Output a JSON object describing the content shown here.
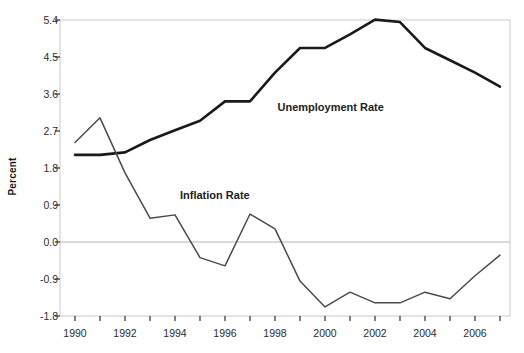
{
  "chart_data": {
    "type": "line",
    "title": "",
    "xlabel": "",
    "ylabel": "Percent",
    "xlim": [
      1989.4,
      2007.4
    ],
    "ylim": [
      -1.8,
      5.4
    ],
    "yticks": [
      -1.8,
      -0.9,
      0.0,
      0.9,
      1.8,
      2.7,
      3.6,
      4.5,
      5.4
    ],
    "ytick_labels": [
      "-1.8",
      "-0.9",
      "0.0",
      "0.9",
      "1.8",
      "2.7",
      "3.6",
      "4.5",
      "5.4"
    ],
    "xticks": [
      1990,
      1991,
      1992,
      1993,
      1994,
      1995,
      1996,
      1997,
      1998,
      1999,
      2000,
      2001,
      2002,
      2003,
      2004,
      2005,
      2006,
      2007
    ],
    "xtick_labels": [
      "1990",
      "",
      "1992",
      "",
      "1994",
      "",
      "1996",
      "",
      "1998",
      "",
      "2000",
      "",
      "2002",
      "",
      "2004",
      "",
      "2006",
      ""
    ],
    "xtick_labels_shown": [
      "1990",
      "1992",
      "1994",
      "1996",
      "1998",
      "2000",
      "2002",
      "2004",
      "2006"
    ],
    "grid": false,
    "zero_reference_line": 0.0,
    "legend_position": "inline-annotation",
    "x": [
      1990,
      1991,
      1992,
      1993,
      1994,
      1995,
      1996,
      1997,
      1998,
      1999,
      2000,
      2001,
      2002,
      2003,
      2004,
      2005,
      2006,
      2007
    ],
    "series": [
      {
        "name": "Unemployment Rate",
        "color": "#1a1a1a",
        "line_width": 2.6,
        "label_x": 1998.1,
        "label_y": 3.25,
        "values": [
          2.12,
          2.12,
          2.18,
          2.48,
          2.72,
          2.95,
          3.42,
          3.42,
          4.12,
          4.72,
          4.72,
          5.05,
          5.41,
          5.35,
          4.72,
          4.42,
          4.12,
          3.78
        ]
      },
      {
        "name": "Inflation Rate",
        "color": "#4a4a4a",
        "line_width": 1.5,
        "label_x": 1994.2,
        "label_y": 1.12,
        "values": [
          2.42,
          3.02,
          1.68,
          0.58,
          0.66,
          -0.38,
          -0.58,
          0.68,
          0.32,
          -0.95,
          -1.58,
          -1.22,
          -1.48,
          -1.48,
          -1.22,
          -1.38,
          -0.82,
          -0.32
        ]
      }
    ]
  }
}
